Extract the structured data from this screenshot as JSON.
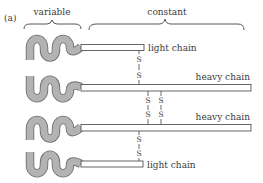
{
  "figure": {
    "panel_label": "(a)",
    "region_labels": {
      "variable": "variable",
      "constant": "constant"
    },
    "chains": [
      {
        "id": "light-top",
        "label": "light chain",
        "type": "light"
      },
      {
        "id": "heavy-1",
        "label": "heavy chain",
        "type": "heavy"
      },
      {
        "id": "heavy-2",
        "label": "heavy chain",
        "type": "heavy"
      },
      {
        "id": "light-bottom",
        "label": "light chain",
        "type": "light"
      }
    ],
    "disulfide_bonds": [
      {
        "between": [
          "light-top",
          "heavy-1"
        ],
        "atoms": [
          "S",
          "S"
        ]
      },
      {
        "between": [
          "heavy-1",
          "heavy-2"
        ],
        "atoms": [
          "S",
          "S"
        ]
      },
      {
        "between": [
          "heavy-1",
          "heavy-2"
        ],
        "atoms": [
          "S",
          "S"
        ]
      },
      {
        "between": [
          "heavy-2",
          "light-bottom"
        ],
        "atoms": [
          "S",
          "S"
        ]
      }
    ],
    "colors": {
      "variable_fill": "#b3b3b3",
      "variable_outline": "#6e6e6e",
      "line": "#444444",
      "text": "#3a3a3a"
    }
  }
}
